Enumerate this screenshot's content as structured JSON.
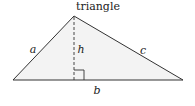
{
  "title": "triangle",
  "labels": {
    "side_a": "a",
    "side_b": "b",
    "side_c": "c",
    "height": "h"
  },
  "colors": {
    "fill": "#f2f2f2",
    "stroke": "#333333"
  }
}
